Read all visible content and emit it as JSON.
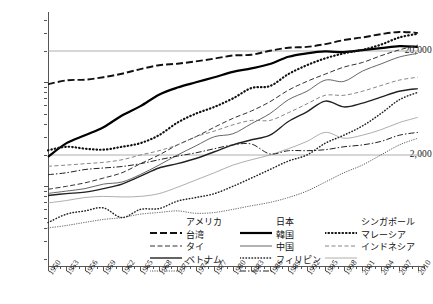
{
  "chart_data": {
    "type": "line",
    "title": "",
    "xlabel": "",
    "ylabel": "",
    "yscale": "log",
    "ylim": [
      300,
      40000
    ],
    "xlim": [
      1950,
      2011
    ],
    "grid": "horizontal-at-labeled-ticks",
    "legend_position": "bottom",
    "y_tick_labels": [
      "20,000",
      "2,000"
    ],
    "y_tick_values": [
      20000,
      2000
    ],
    "x_tick_labels": [
      "1950",
      "1953",
      "1956",
      "1959",
      "1962",
      "1965",
      "1968",
      "1971",
      "1974",
      "1977",
      "1980",
      "1983",
      "1986",
      "1989",
      "1992",
      "1995",
      "1998",
      "2001",
      "2004",
      "2007",
      "2010"
    ],
    "x_tick_values": [
      1950,
      1953,
      1956,
      1959,
      1962,
      1965,
      1968,
      1971,
      1974,
      1977,
      1980,
      1983,
      1986,
      1989,
      1992,
      1995,
      1998,
      2001,
      2004,
      2007,
      2010
    ],
    "x_minor_interval": 1,
    "series": [
      {
        "name": "アメリカ",
        "key_name": "usa",
        "style": "dashed-thick",
        "color": "#111111",
        "width": 1.9,
        "dash": "7,3",
        "x": [
          1950,
          1953,
          1956,
          1959,
          1962,
          1965,
          1968,
          1971,
          1974,
          1977,
          1980,
          1983,
          1986,
          1989,
          1992,
          1995,
          1998,
          2001,
          2004,
          2007,
          2010
        ],
        "y": [
          9561,
          10450,
          10600,
          11200,
          12100,
          13400,
          14600,
          15100,
          15900,
          16900,
          18100,
          18400,
          20100,
          21500,
          21900,
          23300,
          25500,
          27000,
          29000,
          30500,
          29900
        ]
      },
      {
        "name": "日本",
        "key_name": "japan",
        "style": "solid-thick",
        "color": "#000000",
        "width": 2.2,
        "dash": "",
        "x": [
          1950,
          1953,
          1956,
          1959,
          1962,
          1965,
          1968,
          1971,
          1974,
          1977,
          1980,
          1983,
          1986,
          1989,
          1992,
          1995,
          1998,
          2001,
          2004,
          2007,
          2010
        ],
        "y": [
          1921,
          2600,
          3100,
          3700,
          4800,
          5900,
          7600,
          8900,
          10000,
          11200,
          12600,
          13600,
          15000,
          17600,
          19000,
          19800,
          19500,
          20400,
          21300,
          22300,
          21900
        ]
      },
      {
        "name": "シンガポール",
        "key_name": "singapore",
        "style": "dotted-thick",
        "color": "#111111",
        "width": 2.2,
        "dash": "0.5,3",
        "x": [
          1950,
          1953,
          1956,
          1959,
          1962,
          1965,
          1968,
          1971,
          1974,
          1977,
          1980,
          1983,
          1986,
          1989,
          1992,
          1995,
          1998,
          2001,
          2004,
          2007,
          2010
        ],
        "y": [
          2219,
          2400,
          2300,
          2250,
          2400,
          2600,
          3100,
          4100,
          5000,
          5800,
          7000,
          8800,
          9200,
          12000,
          14600,
          17000,
          19000,
          20500,
          23000,
          27000,
          29300
        ]
      },
      {
        "name": "台湾",
        "key_name": "taiwan",
        "style": "dashed",
        "color": "#333333",
        "width": 1.0,
        "dash": "5,2.5",
        "x": [
          1950,
          1953,
          1956,
          1959,
          1962,
          1965,
          1968,
          1971,
          1974,
          1977,
          1980,
          1983,
          1986,
          1989,
          1992,
          1995,
          1998,
          2001,
          2004,
          2007,
          2010
        ],
        "y": [
          936,
          1000,
          1080,
          1200,
          1350,
          1650,
          2000,
          2500,
          3000,
          3700,
          4500,
          5300,
          6500,
          8400,
          10200,
          12000,
          14000,
          15500,
          18000,
          20500,
          22800
        ]
      },
      {
        "name": "韓国",
        "key_name": "korea",
        "style": "solid-thin",
        "color": "#555555",
        "width": 0.9,
        "dash": "",
        "x": [
          1950,
          1953,
          1956,
          1959,
          1962,
          1965,
          1968,
          1971,
          1974,
          1977,
          1980,
          1983,
          1986,
          1989,
          1992,
          1995,
          1998,
          2001,
          2004,
          2007,
          2010
        ],
        "y": [
          854,
          900,
          950,
          1050,
          1100,
          1300,
          1600,
          2000,
          2450,
          3000,
          3200,
          4000,
          5000,
          6800,
          8200,
          10500,
          10200,
          12800,
          15000,
          17500,
          19000
        ]
      },
      {
        "name": "マレーシア",
        "key_name": "malaysia",
        "style": "dashed-light",
        "color": "#777777",
        "width": 0.9,
        "dash": "4,2.5",
        "x": [
          1950,
          1953,
          1956,
          1959,
          1962,
          1965,
          1968,
          1971,
          1974,
          1977,
          1980,
          1983,
          1986,
          1989,
          1992,
          1995,
          1998,
          2001,
          2004,
          2007,
          2010
        ],
        "y": [
          1559,
          1600,
          1650,
          1700,
          1800,
          2000,
          2200,
          2500,
          3000,
          3400,
          3900,
          4300,
          4300,
          5100,
          6200,
          7500,
          7500,
          8200,
          9300,
          10500,
          11200
        ]
      },
      {
        "name": "タイ",
        "key_name": "thailand",
        "style": "solid-med",
        "color": "#222222",
        "width": 1.4,
        "dash": "",
        "x": [
          1950,
          1953,
          1956,
          1959,
          1962,
          1965,
          1968,
          1971,
          1974,
          1977,
          1980,
          1983,
          1986,
          1989,
          1992,
          1995,
          1998,
          2001,
          2004,
          2007,
          2010
        ],
        "y": [
          817,
          850,
          880,
          950,
          1050,
          1250,
          1500,
          1650,
          1850,
          2150,
          2500,
          2800,
          3100,
          4200,
          5200,
          6600,
          5800,
          6300,
          7200,
          8200,
          8700
        ]
      },
      {
        "name": "中国",
        "key_name": "china",
        "style": "dotted-med",
        "color": "#222222",
        "width": 1.5,
        "dash": "0.5,2.5",
        "x": [
          1950,
          1953,
          1956,
          1959,
          1962,
          1965,
          1968,
          1971,
          1974,
          1977,
          1980,
          1983,
          1986,
          1989,
          1992,
          1995,
          1998,
          2001,
          2004,
          2007,
          2010
        ],
        "y": [
          448,
          540,
          580,
          620,
          500,
          600,
          610,
          720,
          780,
          850,
          1000,
          1200,
          1450,
          1750,
          2000,
          2600,
          3100,
          3800,
          5000,
          6800,
          8000
        ]
      },
      {
        "name": "インドネシア",
        "key_name": "indonesia",
        "style": "solid-vthin",
        "color": "#999999",
        "width": 0.8,
        "dash": "",
        "x": [
          1950,
          1953,
          1956,
          1959,
          1962,
          1965,
          1968,
          1971,
          1974,
          1977,
          1980,
          1983,
          1986,
          1989,
          1992,
          1995,
          1998,
          2001,
          2004,
          2007,
          2010
        ],
        "y": [
          693,
          730,
          780,
          800,
          790,
          800,
          850,
          980,
          1150,
          1350,
          1600,
          1800,
          2000,
          2300,
          2700,
          3300,
          2900,
          3100,
          3500,
          4100,
          4600
        ]
      },
      {
        "name": "ベトナム",
        "key_name": "vietnam",
        "style": "dotted-fine",
        "color": "#444444",
        "width": 0.9,
        "dash": "0.4,2",
        "x": [
          1950,
          1953,
          1956,
          1959,
          1962,
          1965,
          1968,
          1971,
          1974,
          1977,
          1980,
          1983,
          1986,
          1989,
          1992,
          1995,
          1998,
          2001,
          2004,
          2007,
          2010
        ],
        "y": [
          398,
          420,
          450,
          480,
          500,
          540,
          560,
          580,
          550,
          560,
          600,
          650,
          700,
          780,
          900,
          1100,
          1350,
          1600,
          2000,
          2500,
          2900
        ]
      },
      {
        "name": "フィリピン",
        "key_name": "philippines",
        "style": "dash-dot",
        "color": "#222222",
        "width": 1.0,
        "dash": "6,2,1.5,2",
        "x": [
          1950,
          1953,
          1956,
          1959,
          1962,
          1965,
          1968,
          1971,
          1974,
          1977,
          1980,
          1983,
          1986,
          1989,
          1992,
          1995,
          1998,
          2001,
          2004,
          2007,
          2010
        ],
        "y": [
          1293,
          1350,
          1450,
          1500,
          1550,
          1650,
          1800,
          1950,
          2100,
          2300,
          2500,
          2550,
          2050,
          2200,
          2200,
          2250,
          2400,
          2500,
          2700,
          3100,
          3300
        ]
      }
    ]
  },
  "legend": {
    "columns": [
      {
        "name": "legend-column-1",
        "rows": [
          {
            "label": "アメリカ",
            "series": "usa"
          },
          {
            "label": "台湾",
            "series": "taiwan"
          },
          {
            "label": "タイ",
            "series": "thailand"
          },
          {
            "label": "ベトナム",
            "series": "vietnam"
          }
        ]
      },
      {
        "name": "legend-column-2",
        "rows": [
          {
            "label": "日本",
            "series": "japan"
          },
          {
            "label": "韓国",
            "series": "korea"
          },
          {
            "label": "中国",
            "series": "china"
          },
          {
            "label": "フィリピン",
            "series": "philippines"
          }
        ]
      },
      {
        "name": "legend-column-3",
        "rows": [
          {
            "label": "シンガポール",
            "series": "singapore"
          },
          {
            "label": "マレーシア",
            "series": "malaysia"
          },
          {
            "label": "インドネシア",
            "series": "indonesia"
          }
        ]
      }
    ]
  }
}
